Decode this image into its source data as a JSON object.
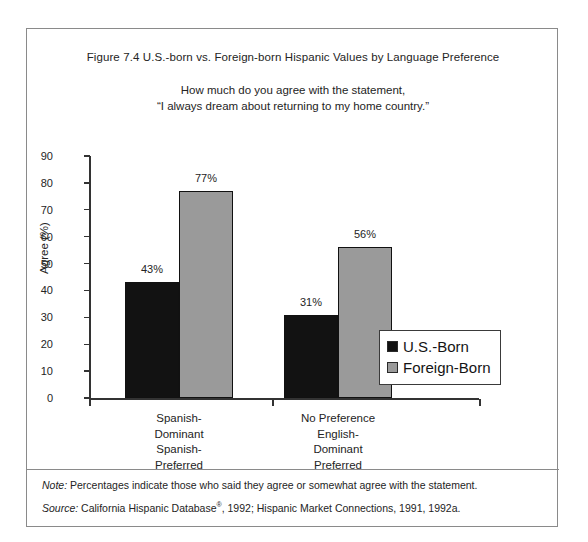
{
  "figure": {
    "title": "Figure 7.4  U.S.-born vs. Foreign-born Hispanic Values by Language Preference",
    "subtitle_line1": "How much do you agree with the statement,",
    "subtitle_line2": "“I always dream about returning to my home country.”",
    "note_lead": "Note:",
    "note_text": " Percentages indicate those who said they agree or somewhat agree with the statement.",
    "source_lead": "Source:",
    "source_text_a": " California Hispanic Database",
    "source_mark": "®",
    "source_text_b": ", 1992; Hispanic Market Connections, 1991, 1992a."
  },
  "chart_data": {
    "type": "bar",
    "title": "Figure 7.4  U.S.-born vs. Foreign-born Hispanic Values by Language Preference",
    "subtitle": "How much do you agree with the statement, “I always dream about returning to my home country.”",
    "xlabel": "",
    "ylabel": "Agree (%)",
    "ylim": [
      0,
      90
    ],
    "yticks": [
      0,
      10,
      20,
      30,
      40,
      50,
      60,
      70,
      80,
      90
    ],
    "ytick_labels": [
      "0",
      "10",
      "20",
      "30",
      "40",
      "50",
      "60",
      "70",
      "80",
      "90"
    ],
    "grid": false,
    "legend_position": "center-right",
    "categories": [
      "Spanish-\nDominant\nSpanish-\nPreferred",
      "No Preference\nEnglish-\nDominant\nPreferred"
    ],
    "category_lines": [
      [
        "Spanish-",
        "Dominant",
        "Spanish-",
        "Preferred"
      ],
      [
        "No  Preference",
        "English-",
        "Dominant",
        "Preferred"
      ]
    ],
    "series": [
      {
        "name": "U.S.-Born",
        "color": "#121212",
        "values": [
          43,
          31
        ],
        "data_labels": [
          "43%",
          "31%"
        ]
      },
      {
        "name": "Foreign-Born",
        "color": "#9a9a9a",
        "values": [
          77,
          56
        ],
        "data_labels": [
          "77%",
          "56%"
        ]
      }
    ]
  },
  "legend": {
    "items": [
      {
        "label": "U.S.-Born",
        "color": "#121212"
      },
      {
        "label": "Foreign-Born",
        "color": "#9a9a9a"
      }
    ]
  }
}
